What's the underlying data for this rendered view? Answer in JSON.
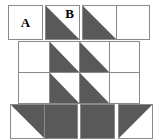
{
  "figure": {
    "colors": {
      "fill_dark": "#595959",
      "fill_light": "#ffffff",
      "stroke": "#8a8a8a",
      "text": "#000000"
    },
    "labels": {
      "a": "A",
      "b": "B"
    },
    "groups": [
      {
        "id": "group-a",
        "name": "square-a",
        "x": 8,
        "y": 5,
        "cell": 33,
        "rows": [
          [
            {
              "fill": "empty",
              "label": "A",
              "label_pos": "center"
            }
          ]
        ]
      },
      {
        "id": "group-b",
        "name": "square-b",
        "x": 45,
        "y": 5,
        "cell": 33,
        "rows": [
          [
            {
              "fill": "tri-bottom-left",
              "label": "B",
              "label_pos": "corner-tr"
            }
          ]
        ]
      },
      {
        "id": "group-c",
        "name": "domino-top-right",
        "x": 82,
        "y": 5,
        "cell": 33,
        "rows": [
          [
            {
              "fill": "tri-bottom-left",
              "label": ""
            },
            {
              "fill": "empty",
              "label": ""
            }
          ]
        ]
      },
      {
        "id": "group-d",
        "name": "middle-grid-4x2",
        "x": 18,
        "y": 41,
        "cell": 30,
        "rows": [
          [
            {
              "fill": "empty",
              "label": ""
            },
            {
              "fill": "tri-bottom-left",
              "label": ""
            },
            {
              "fill": "tri-bottom-left",
              "label": ""
            },
            {
              "fill": "empty",
              "label": ""
            }
          ],
          [
            {
              "fill": "empty",
              "label": ""
            },
            {
              "fill": "tri-bottom-left",
              "label": ""
            },
            {
              "fill": "tri-bottom-left",
              "label": ""
            },
            {
              "fill": "empty",
              "label": ""
            }
          ]
        ]
      },
      {
        "id": "group-e",
        "name": "bottom-domino-left",
        "x": 10,
        "y": 104,
        "cell": 33,
        "rows": [
          [
            {
              "fill": "tri-top-right",
              "label": ""
            },
            {
              "fill": "solid",
              "label": ""
            }
          ]
        ]
      },
      {
        "id": "group-f",
        "name": "bottom-solid-square-1",
        "x": 80,
        "y": 104,
        "cell": 33,
        "rows": [
          [
            {
              "fill": "solid",
              "label": ""
            }
          ]
        ]
      },
      {
        "id": "group-g",
        "name": "bottom-solid-square-2",
        "x": 118,
        "y": 104,
        "cell": 33,
        "rows": [
          [
            {
              "fill": "tri-top-left",
              "label": ""
            }
          ]
        ]
      }
    ]
  }
}
